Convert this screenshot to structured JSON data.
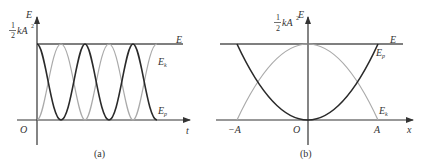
{
  "figure": {
    "panel_a": {
      "caption": "(a)",
      "y_axis_label": "E",
      "x_axis_label": "t",
      "origin_label": "O",
      "energy_level_frac_num": "1",
      "energy_level_frac_den": "2",
      "energy_level_rest": "kA",
      "energy_level_exp": "2",
      "total_energy_label": "E",
      "kinetic_label_main": "E",
      "kinetic_label_sub": "k",
      "potential_label_main": "E",
      "potential_label_sub": "p"
    },
    "panel_b": {
      "caption": "(b)",
      "y_axis_label": "E",
      "x_axis_label": "x",
      "origin_label": "O",
      "neg_amplitude_label": "−A",
      "pos_amplitude_label": "A",
      "energy_level_frac_num": "1",
      "energy_level_frac_den": "2",
      "energy_level_rest": "kA",
      "energy_level_exp": "2",
      "total_energy_label": "E",
      "kinetic_label_main": "E",
      "kinetic_label_sub": "k",
      "potential_label_main": "E",
      "potential_label_sub": "p"
    },
    "colors": {
      "axis": "#333333",
      "total_energy_line": "#555555",
      "potential_curve": "#2a2a2a",
      "kinetic_curve": "#aaaaaa"
    }
  }
}
